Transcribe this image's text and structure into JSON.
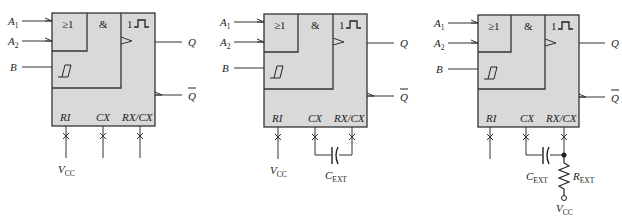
{
  "diagrams": [
    {
      "id": "monostable-a",
      "inputs": {
        "a1": "A",
        "a1_sub": "1",
        "a2": "A",
        "a2_sub": "2",
        "b": "B"
      },
      "gates": {
        "or": "≥1",
        "and": "&",
        "mono": "1"
      },
      "outputs": {
        "q": "Q",
        "qbar": "Q"
      },
      "pins": {
        "ri": "RI",
        "cx": "CX",
        "rxcx": "RX/CX"
      },
      "external": {
        "vcc": "V",
        "vcc_sub": "CC"
      }
    },
    {
      "id": "monostable-b",
      "inputs": {
        "a1": "A",
        "a1_sub": "1",
        "a2": "A",
        "a2_sub": "2",
        "b": "B"
      },
      "gates": {
        "or": "≥1",
        "and": "&",
        "mono": "1"
      },
      "outputs": {
        "q": "Q",
        "qbar": "Q"
      },
      "pins": {
        "ri": "RI",
        "cx": "CX",
        "rxcx": "RX/CX"
      },
      "external": {
        "vcc": "V",
        "vcc_sub": "CC",
        "cext": "C",
        "cext_sub": "EXT"
      }
    },
    {
      "id": "monostable-c",
      "inputs": {
        "a1": "A",
        "a1_sub": "1",
        "a2": "A",
        "a2_sub": "2",
        "b": "B"
      },
      "gates": {
        "or": "≥1",
        "and": "&",
        "mono": "1"
      },
      "outputs": {
        "q": "Q",
        "qbar": "Q"
      },
      "pins": {
        "ri": "RI",
        "cx": "CX",
        "rxcx": "RX/CX"
      },
      "external": {
        "vcc": "V",
        "vcc_sub": "CC",
        "cext": "C",
        "cext_sub": "EXT",
        "rext": "R",
        "rext_sub": "EXT"
      }
    }
  ],
  "colors": {
    "block_fill": "#d9d9d9",
    "line": "#333333"
  }
}
